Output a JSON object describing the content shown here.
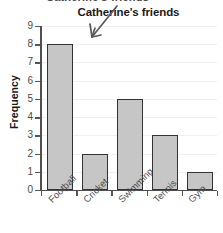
{
  "chart_data": {
    "type": "bar",
    "title": "Catherine's friends",
    "clipped_top_text": "Catherine's friends",
    "categories": [
      "Football",
      "Cricket",
      "Swimming",
      "Tennis",
      "Gym"
    ],
    "values": [
      8,
      2,
      5,
      3,
      1
    ],
    "xlabel": "",
    "ylabel": "Frequency",
    "ylim": [
      0,
      9
    ],
    "yticks": [
      0,
      1,
      2,
      3,
      4,
      5,
      6,
      7,
      8,
      9
    ],
    "ytick_labels": [
      "0",
      "1",
      "2",
      "3",
      "4",
      "5",
      "6",
      "7",
      "8",
      "9"
    ],
    "grid": true,
    "legend": false,
    "bar_color": "#c6c6c6",
    "bar_edge_color": "#333333",
    "axis_color": "#4f4f4f",
    "grid_color": "#f0f0f0",
    "annotations": [
      {
        "name": "arrow-to-title",
        "kind": "hand-drawn-arrow",
        "points_to": "Catherine's friends"
      }
    ]
  }
}
